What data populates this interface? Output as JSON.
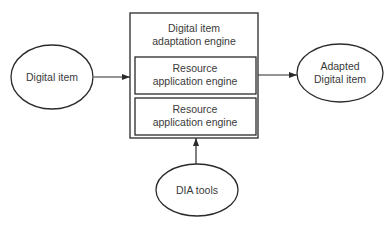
{
  "diagram": {
    "nodes": {
      "input": {
        "label": "Digital item"
      },
      "engine": {
        "title_line1": "Digital item",
        "title_line2": "adaptation engine"
      },
      "resource1": {
        "line1": "Resource",
        "line2": "application engine"
      },
      "resource2": {
        "line1": "Resource",
        "line2": "application engine"
      },
      "output": {
        "line1": "Adapted",
        "line2": "Digital item"
      },
      "tools": {
        "label": "DIA tools"
      }
    },
    "edges": [
      {
        "from": "Digital item",
        "to": "Digital item adaptation engine"
      },
      {
        "from": "Digital item adaptation engine",
        "to": "Adapted Digital item"
      },
      {
        "from": "DIA tools",
        "to": "Digital item adaptation engine"
      }
    ],
    "colors": {
      "stroke": "#2a2a2a",
      "text": "#3a3a3a",
      "background": "#ffffff"
    }
  }
}
